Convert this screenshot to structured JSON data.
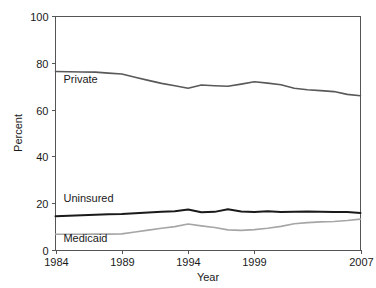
{
  "chart_data": {
    "type": "line",
    "title": "",
    "xlabel": "Year",
    "ylabel": "Percent",
    "xlim": [
      1984,
      2007
    ],
    "ylim": [
      0,
      100
    ],
    "grid": false,
    "legend_position": "inline-labels",
    "xticks": [
      "1984",
      "1989",
      "1994",
      "1999",
      "2007"
    ],
    "xtick_values": [
      1984,
      1989,
      1994,
      1999,
      2007
    ],
    "yticks": [
      "0",
      "20",
      "40",
      "60",
      "80",
      "100"
    ],
    "ytick_values": [
      0,
      20,
      40,
      60,
      80,
      100
    ],
    "x": [
      1984,
      1985,
      1986,
      1987,
      1988,
      1989,
      1990,
      1991,
      1992,
      1993,
      1994,
      1995,
      1996,
      1997,
      1998,
      1999,
      2000,
      2001,
      2002,
      2003,
      2004,
      2005,
      2006,
      2007
    ],
    "series": [
      {
        "name": "Private",
        "color": "#595959",
        "width": 1.6,
        "label": "Private",
        "label_x": 1984.6,
        "label_y": 71.2,
        "values": [
          76.3,
          76.2,
          76.1,
          76.0,
          75.6,
          75.2,
          73.8,
          72.5,
          71.2,
          70.2,
          69.1,
          70.5,
          70.2,
          70.0,
          70.9,
          71.9,
          71.3,
          70.6,
          69.1,
          68.5,
          68.1,
          67.7,
          66.5,
          65.9
        ]
      },
      {
        "name": "Uninsured",
        "color": "#1a1a1a",
        "width": 2.0,
        "label": "Uninsured",
        "label_x": 1984.6,
        "label_y": 20.6,
        "values": [
          14.4,
          14.6,
          14.9,
          15.1,
          15.3,
          15.4,
          15.7,
          16.0,
          16.3,
          16.6,
          17.3,
          16.1,
          16.3,
          17.4,
          16.5,
          16.2,
          16.6,
          16.2,
          16.3,
          16.4,
          16.3,
          16.2,
          16.2,
          15.8
        ]
      },
      {
        "name": "Medicaid",
        "color": "#a6a6a6",
        "width": 1.6,
        "label": "Medicaid",
        "label_x": 1984.6,
        "label_y": 3.6,
        "values": [
          6.7,
          6.7,
          6.7,
          6.8,
          6.8,
          6.9,
          7.7,
          8.5,
          9.3,
          10.0,
          11.1,
          10.3,
          9.6,
          8.6,
          8.4,
          8.7,
          9.3,
          10.1,
          11.2,
          11.7,
          12.0,
          12.2,
          12.6,
          13.2
        ]
      }
    ]
  }
}
